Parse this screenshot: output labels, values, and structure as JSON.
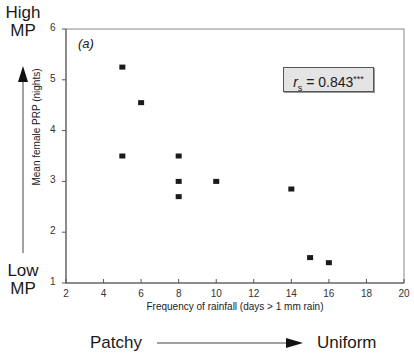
{
  "chart_data": {
    "type": "scatter",
    "panel_label": "(a)",
    "title": "",
    "xlabel": "Frequency of rainfall (days > 1 mm rain)",
    "ylabel": "Mean female PRP (nights)",
    "xlim": [
      2,
      20
    ],
    "ylim": [
      1,
      6
    ],
    "x_ticks": [
      "2",
      "4",
      "6",
      "8",
      "10",
      "12",
      "14",
      "16",
      "18",
      "20"
    ],
    "y_ticks": [
      "1",
      "2",
      "3",
      "4",
      "5",
      "6"
    ],
    "grid": false,
    "legend": null,
    "series": [
      {
        "name": "observations",
        "marker": "square",
        "points": [
          {
            "x": 5,
            "y": 5.25
          },
          {
            "x": 6,
            "y": 4.55
          },
          {
            "x": 5,
            "y": 3.5
          },
          {
            "x": 8,
            "y": 3.5
          },
          {
            "x": 8,
            "y": 3.0
          },
          {
            "x": 10,
            "y": 3.0
          },
          {
            "x": 8,
            "y": 2.7
          },
          {
            "x": 14,
            "y": 2.85
          },
          {
            "x": 15,
            "y": 1.5
          },
          {
            "x": 16,
            "y": 1.4
          }
        ]
      }
    ],
    "annotations": {
      "statistic_symbol": "r",
      "statistic_subscript": "s",
      "statistic_value": " = 0.843",
      "significance": "***"
    }
  },
  "side_labels": {
    "high_line1": "High",
    "high_line2": "MP",
    "low_line1": "Low",
    "low_line2": "MP",
    "patchy": "Patchy",
    "uniform": "Uniform"
  },
  "colors": {
    "marker": "#1a1a1a",
    "axis": "#555555",
    "stat_box_bg": "#e4e4e4"
  }
}
